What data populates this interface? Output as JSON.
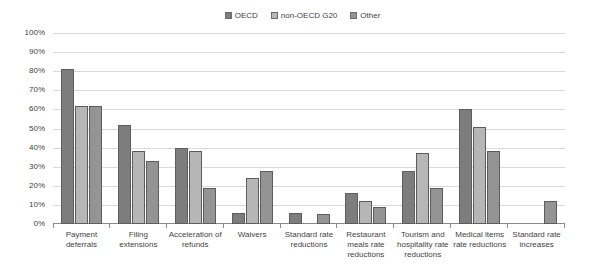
{
  "chart_data": {
    "type": "bar",
    "title": "",
    "subtitle": "",
    "xlabel": "",
    "ylabel": "",
    "ylim": [
      0,
      100
    ],
    "ytick_labels": [
      "100%",
      "90%",
      "80%",
      "70%",
      "60%",
      "50%",
      "40%",
      "30%",
      "20%",
      "10%",
      "0%"
    ],
    "ytick_values": [
      100,
      90,
      80,
      70,
      60,
      50,
      40,
      30,
      20,
      10,
      0
    ],
    "grid": true,
    "legend_position": "top-center",
    "categories": [
      "Payment deferrals",
      "Filing extensions",
      "Acceleration of refunds",
      "Waivers",
      "Standard rate reductions",
      "Restaurant meals rate reductions",
      "Tourism and hospitality rate reductions",
      "Medical items rate reductions",
      "Standard rate increases"
    ],
    "series": [
      {
        "name": "OECD",
        "color": "#7d7d7d",
        "values": [
          81,
          52,
          40,
          6,
          6,
          16,
          28,
          60,
          0
        ]
      },
      {
        "name": "non-OECD G20",
        "color": "#b6b6b6",
        "values": [
          62,
          38,
          38,
          24,
          0,
          12,
          37,
          51,
          0
        ]
      },
      {
        "name": "Other",
        "color": "#949494",
        "values": [
          62,
          33,
          19,
          28,
          5,
          9,
          19,
          38,
          12
        ]
      }
    ]
  }
}
